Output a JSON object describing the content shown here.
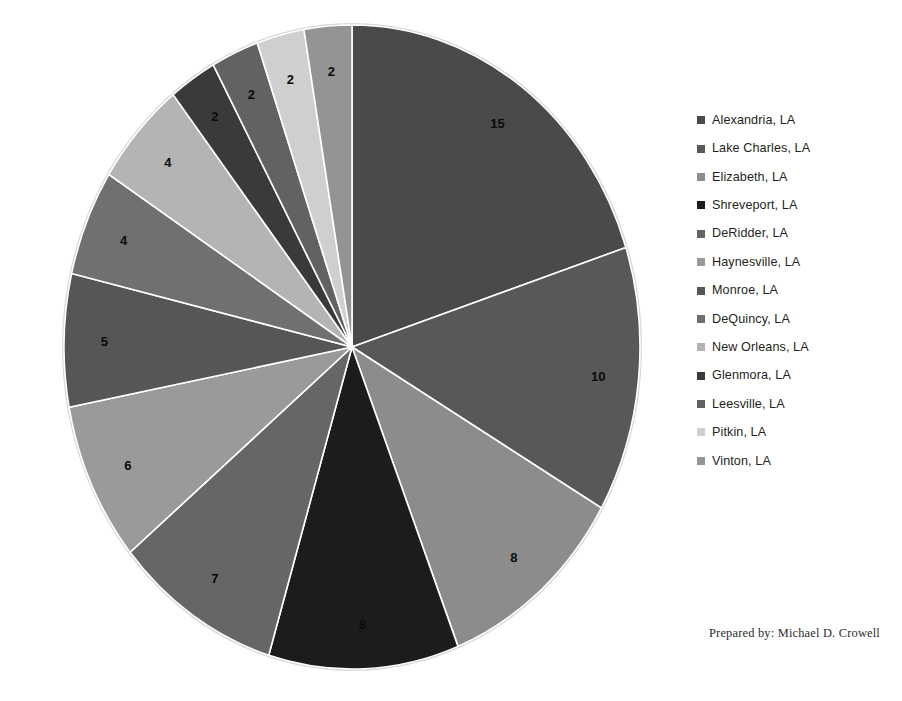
{
  "chart_data": {
    "type": "pie",
    "title": "",
    "categories": [
      "Alexandria, LA",
      "Lake Charles, LA",
      "Elizabeth, LA",
      "Shreveport, LA",
      "DeRidder, LA",
      "Haynesville, LA",
      "Monroe, LA",
      "DeQuincy, LA",
      "New Orleans, LA",
      "Glenmora, LA",
      "Leesville, LA",
      "Pitkin, LA",
      "Vinton, LA"
    ],
    "values": [
      15,
      10,
      8,
      8,
      7,
      6,
      5,
      4,
      4,
      2,
      2,
      2,
      2
    ],
    "total": 73,
    "colors": [
      "#4a4a4a",
      "#585858",
      "#8c8c8c",
      "#1c1c1c",
      "#666666",
      "#9a9a9a",
      "#565656",
      "#707070",
      "#b4b4b4",
      "#3a3a3a",
      "#626262",
      "#cfcfcf",
      "#949494"
    ],
    "data_labels": [
      "15",
      "10",
      "8",
      "8",
      "7",
      "6",
      "5",
      "4",
      "4",
      "2",
      "2",
      "2",
      "2"
    ],
    "show_data_labels": true,
    "start_angle_deg": 0,
    "direction": "clockwise",
    "legend_position": "right",
    "grid": false,
    "slice_border_color": "#ffffff"
  },
  "legend": {
    "items": [
      {
        "label": "Alexandria, LA",
        "color": "#4a4a4a"
      },
      {
        "label": "Lake Charles, LA",
        "color": "#585858"
      },
      {
        "label": "Elizabeth, LA",
        "color": "#8c8c8c"
      },
      {
        "label": "Shreveport, LA",
        "color": "#1c1c1c"
      },
      {
        "label": "DeRidder, LA",
        "color": "#666666"
      },
      {
        "label": "Haynesville, LA",
        "color": "#9a9a9a"
      },
      {
        "label": "Monroe, LA",
        "color": "#565656"
      },
      {
        "label": "DeQuincy, LA",
        "color": "#707070"
      },
      {
        "label": "New Orleans, LA",
        "color": "#b4b4b4"
      },
      {
        "label": "Glenmora, LA",
        "color": "#3a3a3a"
      },
      {
        "label": "Leesville, LA",
        "color": "#626262"
      },
      {
        "label": "Pitkin, LA",
        "color": "#cfcfcf"
      },
      {
        "label": "Vinton, LA",
        "color": "#949494"
      }
    ]
  },
  "footer": {
    "credit": "Prepared by:  Michael D. Crowell"
  },
  "geometry": {
    "center_x": 352,
    "center_y": 347,
    "radius_x": 288,
    "radius_y": 322,
    "label_radius_factor": 0.86
  }
}
